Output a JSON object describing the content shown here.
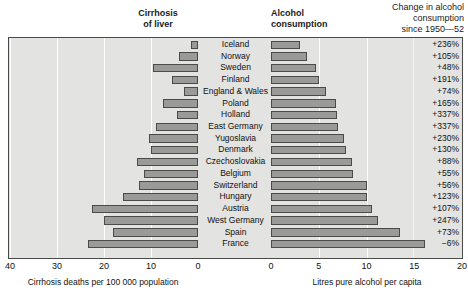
{
  "header": {
    "cirrhosis_title": "Cirrhosis\nof liver",
    "alcohol_title": "Alcohol\nconsumption",
    "change_title": "Change in alcohol\nconsumption\nsince 1950—52"
  },
  "axes": {
    "left_caption": "Cirrhosis deaths per 100 000 population",
    "right_caption": "Litres pure alcohol per capita",
    "left_ticks": [
      "40",
      "30",
      "20",
      "10",
      "0"
    ],
    "right_ticks": [
      "0",
      "5",
      "10",
      "15",
      "20"
    ],
    "left_min": 0,
    "left_max": 40,
    "right_min": 0,
    "right_max": 20
  },
  "colors": {
    "bar_fill": "#9a9a98",
    "bar_stroke": "#4a4a48",
    "plot_bg": "#e3e3e1",
    "gridline": "#ffffff"
  },
  "chart_data": {
    "type": "bar",
    "orientation": "horizontal-diverging",
    "categories": [
      "Iceland",
      "Norway",
      "Sweden",
      "Finland",
      "England & Wales",
      "Poland",
      "Holland",
      "East Germany",
      "Yugoslavia",
      "Denmark",
      "Czechoslovakia",
      "Belgium",
      "Switzerland",
      "Hungary",
      "Austria",
      "West Germany",
      "Spain",
      "France"
    ],
    "series": [
      {
        "name": "Cirrhosis deaths per 100 000 population",
        "side": "left",
        "xlabel": "Cirrhosis deaths per 100 000 population",
        "xlim": [
          40,
          0
        ],
        "values": [
          1.5,
          4.0,
          9.5,
          5.5,
          3.0,
          7.5,
          4.5,
          9.0,
          10.5,
          10.0,
          13.0,
          11.5,
          12.5,
          16.0,
          22.5,
          20.0,
          18.0,
          23.5
        ]
      },
      {
        "name": "Litres pure alcohol per capita",
        "side": "right",
        "xlabel": "Litres pure alcohol per capita",
        "xlim": [
          0,
          20
        ],
        "values": [
          3.0,
          3.8,
          4.7,
          5.0,
          5.8,
          6.8,
          6.9,
          7.0,
          7.6,
          7.9,
          8.5,
          8.6,
          10.0,
          10.0,
          10.6,
          11.2,
          13.5,
          16.1
        ]
      }
    ],
    "annotations": {
      "label": "Change in alcohol consumption since 1950—52",
      "values": [
        "+236%",
        "+105%",
        "+48%",
        "+191%",
        "+74%",
        "+165%",
        "+337%",
        "+337%",
        "+230%",
        "+130%",
        "+88%",
        "+55%",
        "+56%",
        "+123%",
        "+107%",
        "+247%",
        "+73%",
        "−6%"
      ]
    },
    "grid": "vertical-only",
    "legend": "none"
  }
}
